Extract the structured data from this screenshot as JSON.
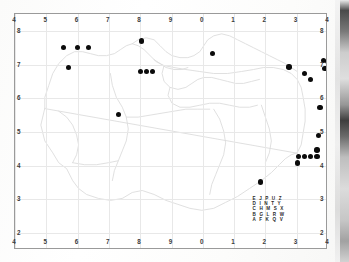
{
  "figure": {
    "type": "distribution-map",
    "background_color": "#ffffff",
    "frame_color": "#9a9a9a",
    "point_color": "#0b0b0b",
    "grid_color": "#e8e8e8",
    "map_outline_color": "#d9d9d9"
  },
  "axes": {
    "top_ticks": [
      "4",
      "5",
      "6",
      "7",
      "8",
      "9",
      "0",
      "1",
      "2",
      "3",
      "4"
    ],
    "bottom_ticks": [
      "4",
      "5",
      "6",
      "7",
      "8",
      "9",
      "0",
      "1",
      "2",
      "3",
      "4"
    ],
    "left_ticks": [
      "8",
      "7",
      "6",
      "5",
      "4",
      "3",
      "2"
    ],
    "right_ticks": [
      "8",
      "7",
      "6",
      "5",
      "4",
      "3",
      "2"
    ]
  },
  "legend_grid": {
    "rows": [
      "E J P U Z",
      "D I N T Y",
      "C H M S X",
      "B G L R W",
      "A F K Q V"
    ]
  },
  "chart_data": {
    "type": "scatter",
    "title": "",
    "xlabel": "",
    "ylabel": "",
    "xlim": [
      4,
      14
    ],
    "ylim": [
      1.5,
      8.5
    ],
    "x_tick_labels": [
      "4",
      "5",
      "6",
      "7",
      "8",
      "9",
      "0",
      "1",
      "2",
      "3",
      "4"
    ],
    "x_tick_values": [
      4,
      5,
      6,
      7,
      8,
      9,
      10,
      11,
      12,
      13,
      14
    ],
    "y_tick_labels": [
      "8",
      "7",
      "6",
      "5",
      "4",
      "3",
      "2"
    ],
    "y_tick_values": [
      8,
      7,
      6,
      5,
      4,
      3,
      2
    ],
    "grid": true,
    "legend_position": "none",
    "marker": "filled-circle",
    "series": [
      {
        "name": "occurrence-records",
        "color": "#0b0b0b",
        "points": [
          [
            5.55,
            7.5
          ],
          [
            6.0,
            7.5
          ],
          [
            6.35,
            7.5
          ],
          [
            5.7,
            6.92
          ],
          [
            8.05,
            7.7
          ],
          [
            8.0,
            6.8
          ],
          [
            8.2,
            6.8
          ],
          [
            8.4,
            6.8
          ],
          [
            7.3,
            5.52
          ],
          [
            10.3,
            7.32
          ],
          [
            12.75,
            6.93
          ],
          [
            13.85,
            7.12
          ],
          [
            14.0,
            7.1
          ],
          [
            13.9,
            6.88
          ],
          [
            14.1,
            6.88
          ],
          [
            13.25,
            6.73
          ],
          [
            13.45,
            6.55
          ],
          [
            13.75,
            5.73
          ],
          [
            13.7,
            4.9
          ],
          [
            13.65,
            4.47
          ],
          [
            13.05,
            4.28
          ],
          [
            13.25,
            4.28
          ],
          [
            13.45,
            4.28
          ],
          [
            13.65,
            4.28
          ],
          [
            13.02,
            4.08
          ],
          [
            11.85,
            3.52
          ]
        ]
      }
    ]
  }
}
